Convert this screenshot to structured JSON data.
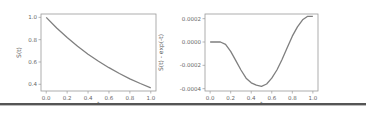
{
  "chart_data": [
    {
      "type": "line",
      "title": "",
      "xlabel": "t",
      "ylabel": "S(t)",
      "xlim": [
        -0.05,
        1.05
      ],
      "ylim": [
        0.34,
        1.03
      ],
      "xticks": [
        "0.0",
        "0.2",
        "0.4",
        "0.6",
        "0.8",
        "1.0"
      ],
      "yticks": [
        "0.4",
        "0.6",
        "0.8",
        "1.0"
      ],
      "grid": false,
      "legend": null,
      "line_color": "#7f7f7f",
      "x": [
        0.0,
        0.1,
        0.2,
        0.3,
        0.4,
        0.5,
        0.6,
        0.7,
        0.8,
        0.9,
        1.0
      ],
      "values": [
        1.0,
        0.905,
        0.819,
        0.741,
        0.67,
        0.607,
        0.549,
        0.497,
        0.449,
        0.407,
        0.368
      ]
    },
    {
      "type": "line",
      "title": "",
      "xlabel": "t",
      "ylabel": "S(t) - exp(-t)",
      "xlim": [
        -0.05,
        1.05
      ],
      "ylim": [
        -0.00042,
        0.00024
      ],
      "xticks": [
        "0.0",
        "0.2",
        "0.4",
        "0.6",
        "0.8",
        "1.0"
      ],
      "yticks": [
        "0.0002",
        "0.0000",
        "-0.0002",
        "-0.0004"
      ],
      "grid": false,
      "legend": null,
      "line_color": "#7f7f7f",
      "x": [
        0.0,
        0.05,
        0.1,
        0.15,
        0.2,
        0.25,
        0.3,
        0.35,
        0.4,
        0.45,
        0.5,
        0.55,
        0.6,
        0.65,
        0.7,
        0.75,
        0.8,
        0.85,
        0.9,
        0.95,
        1.0
      ],
      "values": [
        0.0,
        0.0,
        0.0,
        -2e-05,
        -8e-05,
        -0.00016,
        -0.00024,
        -0.00031,
        -0.00035,
        -0.00037,
        -0.00038,
        -0.00036,
        -0.00031,
        -0.00024,
        -0.00015,
        -5e-05,
        5e-05,
        0.00013,
        0.00019,
        0.00022,
        0.00022
      ]
    }
  ]
}
